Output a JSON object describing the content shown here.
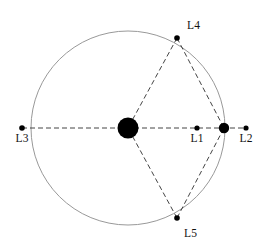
{
  "figure": {
    "type": "diagram",
    "width": 272,
    "height": 247,
    "background_color": "#ffffff"
  },
  "colors": {
    "body_fill": "#000000",
    "point_fill": "#000000",
    "orbit_stroke": "#999999",
    "dashed_stroke": "#444444",
    "label_color": "#111111"
  },
  "orbit": {
    "name": "secondary-orbit-circle",
    "center_x": 128,
    "center_y": 128,
    "radius": 97,
    "stroke_width": 1,
    "style": "solid"
  },
  "bodies": [
    {
      "id": "primary",
      "label": "",
      "cx": 128,
      "cy": 128,
      "r": 10.5
    },
    {
      "id": "secondary",
      "label": "",
      "cx": 224,
      "cy": 128,
      "r": 5.2
    }
  ],
  "lagrange_points": [
    {
      "id": "L1",
      "label": "L1",
      "cx": 197,
      "cy": 128,
      "r": 2.6,
      "label_x": 197,
      "label_y": 142,
      "label_anchor": "middle"
    },
    {
      "id": "L2",
      "label": "L2",
      "cx": 246,
      "cy": 128,
      "r": 2.6,
      "label_x": 246,
      "label_y": 142,
      "label_anchor": "middle"
    },
    {
      "id": "L3",
      "label": "L3",
      "cx": 22,
      "cy": 128,
      "r": 2.8,
      "label_x": 22,
      "label_y": 142,
      "label_anchor": "middle"
    },
    {
      "id": "L4",
      "label": "L4",
      "cx": 177,
      "cy": 38,
      "r": 2.8,
      "label_x": 187,
      "label_y": 29,
      "label_anchor": "start"
    },
    {
      "id": "L5",
      "label": "L5",
      "cx": 177,
      "cy": 218,
      "r": 2.8,
      "label_x": 184,
      "label_y": 237,
      "label_anchor": "start"
    }
  ],
  "dashed_lines": [
    {
      "id": "axis-line",
      "name": "horizontal-axis-dashed-line",
      "x1": 22,
      "y1": 128,
      "x2": 246,
      "y2": 128
    },
    {
      "id": "l4-primary",
      "name": "l4-to-primary-dashed-line",
      "x1": 177,
      "y1": 38,
      "x2": 128,
      "y2": 128
    },
    {
      "id": "l4-secondary",
      "name": "l4-to-secondary-dashed-line",
      "x1": 177,
      "y1": 38,
      "x2": 224,
      "y2": 128
    },
    {
      "id": "l5-primary",
      "name": "l5-to-primary-dashed-line",
      "x1": 177,
      "y1": 218,
      "x2": 128,
      "y2": 128
    },
    {
      "id": "l5-secondary",
      "name": "l5-to-secondary-dashed-line",
      "x1": 177,
      "y1": 218,
      "x2": 224,
      "y2": 128
    }
  ],
  "dash_pattern": "5,3"
}
